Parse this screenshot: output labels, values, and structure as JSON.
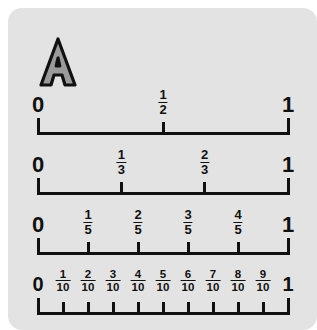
{
  "card": {
    "background_color": "#e3e3e3",
    "badge": {
      "label": "A",
      "fill_color": "#9a9a9a",
      "outline_color": "#111111"
    }
  },
  "chart_data": {
    "type": "table",
    "axis_color": "#111111",
    "xlim": [
      0,
      1
    ],
    "lines": [
      {
        "name": "halves",
        "denominator": 2,
        "start_label": "0",
        "end_label": "1",
        "ticks": [
          {
            "value": 0,
            "label": "0",
            "kind": "end"
          },
          {
            "value": 0.5,
            "numerator": "1",
            "denominator": "2",
            "kind": "mid"
          },
          {
            "value": 1,
            "label": "1",
            "kind": "end"
          }
        ]
      },
      {
        "name": "thirds",
        "denominator": 3,
        "start_label": "0",
        "end_label": "1",
        "ticks": [
          {
            "value": 0,
            "label": "0",
            "kind": "end"
          },
          {
            "value": 0.3333,
            "numerator": "1",
            "denominator": "3",
            "kind": "mid"
          },
          {
            "value": 0.6667,
            "numerator": "2",
            "denominator": "3",
            "kind": "mid"
          },
          {
            "value": 1,
            "label": "1",
            "kind": "end"
          }
        ]
      },
      {
        "name": "fifths",
        "denominator": 5,
        "start_label": "0",
        "end_label": "1",
        "ticks": [
          {
            "value": 0,
            "label": "0",
            "kind": "end"
          },
          {
            "value": 0.2,
            "numerator": "1",
            "denominator": "5",
            "kind": "mid"
          },
          {
            "value": 0.4,
            "numerator": "2",
            "denominator": "5",
            "kind": "mid"
          },
          {
            "value": 0.6,
            "numerator": "3",
            "denominator": "5",
            "kind": "mid"
          },
          {
            "value": 0.8,
            "numerator": "4",
            "denominator": "5",
            "kind": "mid"
          },
          {
            "value": 1,
            "label": "1",
            "kind": "end"
          }
        ]
      },
      {
        "name": "tenths",
        "denominator": 10,
        "start_label": "0",
        "end_label": "1",
        "ticks": [
          {
            "value": 0,
            "label": "0",
            "kind": "end"
          },
          {
            "value": 0.1,
            "numerator": "1",
            "denominator": "10",
            "kind": "mid"
          },
          {
            "value": 0.2,
            "numerator": "2",
            "denominator": "10",
            "kind": "mid"
          },
          {
            "value": 0.3,
            "numerator": "3",
            "denominator": "10",
            "kind": "mid"
          },
          {
            "value": 0.4,
            "numerator": "4",
            "denominator": "10",
            "kind": "mid"
          },
          {
            "value": 0.5,
            "numerator": "5",
            "denominator": "10",
            "kind": "mid"
          },
          {
            "value": 0.6,
            "numerator": "6",
            "denominator": "10",
            "kind": "mid"
          },
          {
            "value": 0.7,
            "numerator": "7",
            "denominator": "10",
            "kind": "mid"
          },
          {
            "value": 0.8,
            "numerator": "8",
            "denominator": "10",
            "kind": "mid"
          },
          {
            "value": 0.9,
            "numerator": "9",
            "denominator": "10",
            "kind": "mid"
          },
          {
            "value": 1,
            "label": "1",
            "kind": "end"
          }
        ]
      }
    ]
  }
}
